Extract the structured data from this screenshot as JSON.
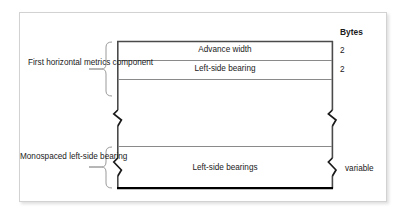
{
  "figure": {
    "title_column_header": "Bytes",
    "left_captions": [
      {
        "id": "first-horizontal-metrics-component",
        "text": "First horizontal metrics component"
      },
      {
        "id": "monospaced-left-side-bearing",
        "text": "Monospaced left-side bearing"
      }
    ],
    "rows": [
      {
        "id": "advance-width",
        "label": "Advance width",
        "bytes": "2"
      },
      {
        "id": "left-side-bearing",
        "label": "Left-side bearing",
        "bytes": "2"
      },
      {
        "id": "left-side-bearings",
        "label": "Left-side bearings",
        "bytes": "variable"
      }
    ],
    "colors": {
      "frame_border": "#d2d2d2",
      "box_outline": "#4a4a4a",
      "box_bottom_rule": "#000000",
      "row_divider": "#8a8a8a",
      "brace": "#9a9a9a",
      "text": "#1a1a1a",
      "background": "#ffffff"
    }
  }
}
